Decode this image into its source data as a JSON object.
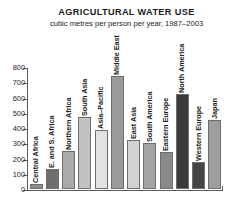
{
  "chart_data": {
    "type": "bar",
    "title": "AGRICULTURAL WATER USE",
    "subtitle": "cubic metres per person per year, 1987–2003",
    "xlabel": "",
    "ylabel": "",
    "ylim": [
      0,
      800
    ],
    "yticks": [
      0,
      100,
      200,
      300,
      400,
      500,
      600,
      700,
      800
    ],
    "ytick_labels": [
      "0",
      "100",
      "200",
      "300",
      "400",
      "500",
      "600",
      "700",
      "800"
    ],
    "grid": false,
    "legend": "none",
    "categories": [
      "Central Africa",
      "E. and S. Africa",
      "Northern Africa",
      "South Asia",
      "Asia–Pacific",
      "Middle East",
      "East Asia",
      "South America",
      "Eastern Europe",
      "North America",
      "Western Europe",
      "Japan"
    ],
    "values": [
      30,
      130,
      250,
      470,
      390,
      740,
      320,
      300,
      240,
      620,
      180,
      450
    ],
    "bar_colors": [
      "#8e8e8e",
      "#6f6f6f",
      "#aaaaaa",
      "#c2c2c2",
      "#e2e2e2",
      "#9a9a9a",
      "#d2d2d2",
      "#a3a3a3",
      "#8a8a8a",
      "#3b3b3b",
      "#454545",
      "#9e9e9e"
    ]
  },
  "figure": {
    "background": "#ffffff",
    "axis_color": "#5b5b5b",
    "text_color": "#1c1c1c"
  }
}
